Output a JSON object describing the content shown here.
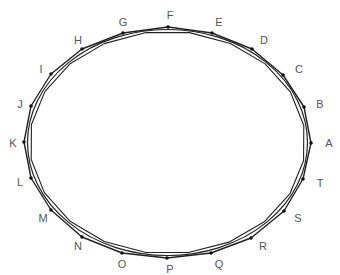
{
  "diagram": {
    "type": "inscribed-polygon-ellipse",
    "stroke_color": "#222222",
    "label_color": "#555555",
    "ellipse": {
      "cx": 167.5,
      "cy": 142.5,
      "rx": 140,
      "ry": 113
    },
    "points": [
      {
        "label": "A",
        "x": 311,
        "y": 143,
        "lx": 329,
        "ly": 143
      },
      {
        "label": "B",
        "x": 304,
        "y": 107,
        "lx": 320,
        "ly": 104
      },
      {
        "label": "C",
        "x": 283,
        "y": 75,
        "lx": 299,
        "ly": 69
      },
      {
        "label": "D",
        "x": 252,
        "y": 49,
        "lx": 264,
        "ly": 40
      },
      {
        "label": "E",
        "x": 212,
        "y": 33,
        "lx": 219,
        "ly": 22
      },
      {
        "label": "F",
        "x": 168,
        "y": 27,
        "lx": 170,
        "ly": 15
      },
      {
        "label": "G",
        "x": 123,
        "y": 33,
        "lx": 123,
        "ly": 22
      },
      {
        "label": "H",
        "x": 82,
        "y": 49,
        "lx": 78,
        "ly": 40
      },
      {
        "label": "I",
        "x": 51,
        "y": 74,
        "lx": 41,
        "ly": 69
      },
      {
        "label": "J",
        "x": 31,
        "y": 106,
        "lx": 20,
        "ly": 104
      },
      {
        "label": "K",
        "x": 24,
        "y": 142,
        "lx": 13,
        "ly": 143
      },
      {
        "label": "L",
        "x": 31,
        "y": 178,
        "lx": 20,
        "ly": 182
      },
      {
        "label": "M",
        "x": 51,
        "y": 210,
        "lx": 43,
        "ly": 218
      },
      {
        "label": "N",
        "x": 82,
        "y": 237,
        "lx": 78,
        "ly": 246
      },
      {
        "label": "O",
        "x": 122,
        "y": 253,
        "lx": 122,
        "ly": 264
      },
      {
        "label": "P",
        "x": 167,
        "y": 258,
        "lx": 170,
        "ly": 269
      },
      {
        "label": "Q",
        "x": 211,
        "y": 253,
        "lx": 219,
        "ly": 264
      },
      {
        "label": "R",
        "x": 251,
        "y": 238,
        "lx": 263,
        "ly": 246
      },
      {
        "label": "S",
        "x": 284,
        "y": 211,
        "lx": 298,
        "ly": 218
      },
      {
        "label": "T",
        "x": 303,
        "y": 179,
        "lx": 320,
        "ly": 183
      }
    ]
  }
}
